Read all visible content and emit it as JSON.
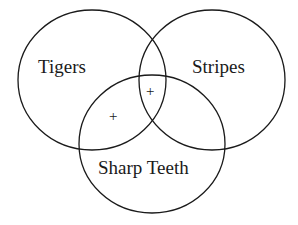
{
  "diagram": {
    "type": "venn",
    "sets": [
      {
        "name": "Tigers"
      },
      {
        "name": "Stripes"
      },
      {
        "name": "Sharp Teeth"
      }
    ],
    "marks": [
      {
        "symbol": "+",
        "region": "Tigers ∩ Stripes ∩ Sharp Teeth"
      },
      {
        "symbol": "+",
        "region": "Tigers ∩ Sharp Teeth (not Stripes)"
      }
    ]
  }
}
